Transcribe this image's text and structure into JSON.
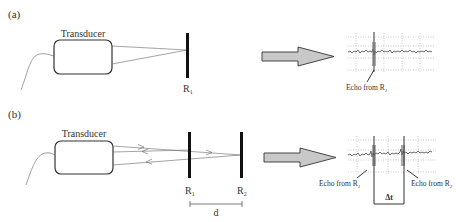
{
  "panels": {
    "a": {
      "label": "(a)",
      "transducer_label": "Transducer",
      "reflector_label": "R",
      "reflector_sub": "1",
      "echo_label": "Echo from R",
      "echo_sub": "1"
    },
    "b": {
      "label": "(b)",
      "transducer_label": "Transducer",
      "reflector1_label": "R",
      "reflector1_sub": "1",
      "reflector2_label": "R",
      "reflector2_sub": "2",
      "distance_label": "d",
      "echo1_label": "Echo from R",
      "echo1_sub": "1",
      "echo2_label": "Echo from R",
      "echo2_sub": "2",
      "delta_t_label": "Δt"
    }
  },
  "colors": {
    "line": "#555555",
    "reflector": "#111111",
    "arrow_fill": "#c8c8c8",
    "grid": "#aaaaaa"
  }
}
